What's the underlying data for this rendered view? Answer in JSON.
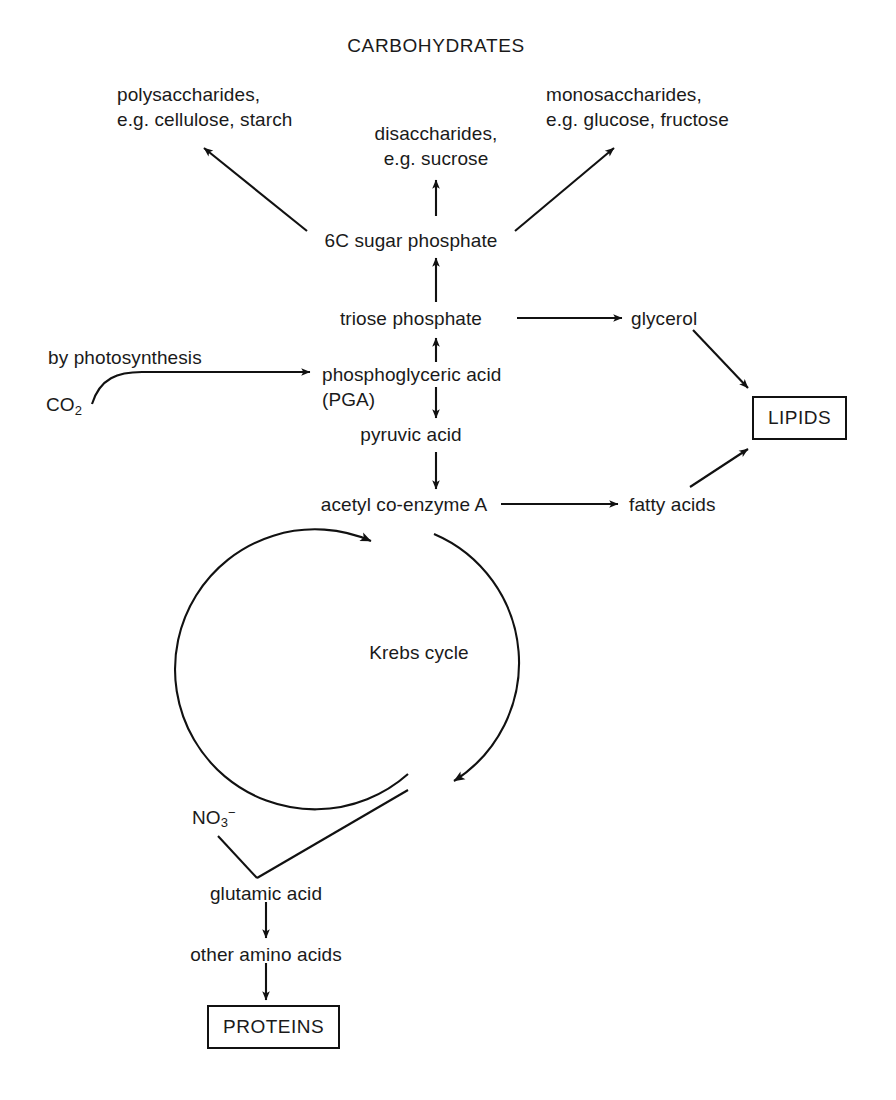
{
  "diagram": {
    "title": "CARBOHYDRATES",
    "type": "metabolic-pathway-flowchart",
    "background_color": "#ffffff",
    "line_color": "#111111",
    "text_color": "#1a1a1a"
  },
  "nodes": {
    "carbohydrates_heading": "CARBOHYDRATES",
    "polysaccharides_line1": "polysaccharides,",
    "polysaccharides_line2": "e.g. cellulose, starch",
    "disaccharides_line1": "disaccharides,",
    "disaccharides_line2": "e.g. sucrose",
    "monosaccharides_line1": "monosaccharides,",
    "monosaccharides_line2": "e.g. glucose, fructose",
    "six_c_sugar_phosphate": "6C sugar phosphate",
    "triose_phosphate": "triose phosphate",
    "phosphoglyceric_acid_line1": "phosphoglyceric acid",
    "phosphoglyceric_acid_line2": "(PGA)",
    "pyruvic_acid": "pyruvic acid",
    "acetyl_coenzyme_a": "acetyl co-enzyme A",
    "krebs_cycle": "Krebs cycle",
    "glycerol": "glycerol",
    "fatty_acids": "fatty acids",
    "lipids_box": "LIPIDS",
    "glutamic_acid": "glutamic acid",
    "other_amino_acids": "other amino acids",
    "proteins_box": "PROTEINS",
    "co2_formula": "CO",
    "co2_subscript": "2",
    "nitrate_formula": "NO",
    "nitrate_subscript": "3",
    "nitrate_charge": "−"
  },
  "edge_labels": {
    "photosynthesis": "by photosynthesis"
  },
  "edges": [
    {
      "from": "6C sugar phosphate",
      "to": "polysaccharides, e.g. cellulose, starch",
      "style": "straight-arrow"
    },
    {
      "from": "6C sugar phosphate",
      "to": "disaccharides, e.g. sucrose",
      "style": "straight-arrow"
    },
    {
      "from": "6C sugar phosphate",
      "to": "monosaccharides, e.g. glucose, fructose",
      "style": "straight-arrow"
    },
    {
      "from": "triose phosphate",
      "to": "6C sugar phosphate",
      "style": "straight-arrow"
    },
    {
      "from": "triose phosphate",
      "to": "glycerol",
      "style": "straight-arrow"
    },
    {
      "from": "phosphoglyceric acid (PGA)",
      "to": "triose phosphate",
      "style": "straight-arrow"
    },
    {
      "from": "phosphoglyceric acid (PGA)",
      "to": "pyruvic acid",
      "style": "straight-arrow"
    },
    {
      "from": "pyruvic acid",
      "to": "acetyl co-enzyme A",
      "style": "straight-arrow"
    },
    {
      "from": "acetyl co-enzyme A",
      "to": "fatty acids",
      "style": "straight-arrow"
    },
    {
      "from": "CO2",
      "to": "phosphoglyceric acid (PGA)",
      "style": "curved-arrow",
      "label": "by photosynthesis"
    },
    {
      "from": "glycerol",
      "to": "LIPIDS",
      "style": "straight-arrow"
    },
    {
      "from": "fatty acids",
      "to": "LIPIDS",
      "style": "straight-arrow"
    },
    {
      "from": "acetyl co-enzyme A",
      "to": "Krebs cycle",
      "style": "circular-arc"
    },
    {
      "from": "Krebs cycle",
      "to": "glutamic acid",
      "style": "straight-arrow-bidirectional"
    },
    {
      "from": "NO3-",
      "to": "glutamic acid",
      "style": "plain-line"
    },
    {
      "from": "glutamic acid",
      "to": "other amino acids",
      "style": "straight-arrow"
    },
    {
      "from": "other amino acids",
      "to": "PROTEINS",
      "style": "straight-arrow"
    }
  ]
}
